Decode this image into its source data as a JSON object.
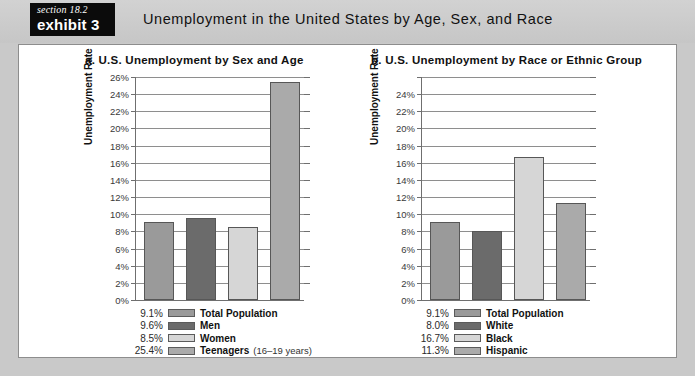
{
  "header": {
    "badge_section": "section 18.2",
    "badge_exhibit": "exhibit 3",
    "title": "Unemployment in the United States by Age, Sex, and Race"
  },
  "colors": {
    "page_background": "#c9c9c9",
    "panel_background": "#ffffff",
    "badge_background": "#0b0b0b",
    "axis": "#6f6f6f",
    "gridline": "#8e8e8e"
  },
  "chart_data": [
    {
      "type": "bar",
      "id": "a",
      "title": "a. U.S. Unemployment by Sex and Age",
      "xlabel": "",
      "ylabel": "Unemployment Rate",
      "ylim": [
        0,
        26
      ],
      "grid": true,
      "legend_position": "bottom-left",
      "yticks": [
        0,
        2,
        4,
        6,
        8,
        10,
        12,
        14,
        16,
        18,
        20,
        22,
        24,
        26
      ],
      "ytick_labels": [
        "0%",
        "2%",
        "4%",
        "6%",
        "8%",
        "10%",
        "12%",
        "14%",
        "16%",
        "18%",
        "20%",
        "22%",
        "24%",
        "26%"
      ],
      "categories": [
        "Total Population",
        "Men",
        "Women",
        "Teenagers"
      ],
      "values": [
        9.1,
        9.6,
        8.5,
        25.4
      ],
      "value_labels": [
        "9.1%",
        "9.6%",
        "8.5%",
        "25.4%"
      ],
      "bar_colors": [
        "#9a9a9a",
        "#6b6b6b",
        "#d6d6d6",
        "#aaaaaa"
      ],
      "legend": [
        {
          "value": "9.1%",
          "label": "Total Population",
          "note": "",
          "color": "#9a9a9a"
        },
        {
          "value": "9.6%",
          "label": "Men",
          "note": "",
          "color": "#6b6b6b"
        },
        {
          "value": "8.5%",
          "label": "Women",
          "note": "",
          "color": "#d6d6d6"
        },
        {
          "value": "25.4%",
          "label": "Teenagers",
          "note": "(16–19 years)",
          "color": "#aaaaaa"
        }
      ]
    },
    {
      "type": "bar",
      "id": "b",
      "title": "b. U.S. Unemployment by Race or Ethnic Group",
      "xlabel": "",
      "ylabel": "Unemployment Rate",
      "ylim": [
        0,
        26
      ],
      "grid": true,
      "legend_position": "bottom-left",
      "yticks": [
        0,
        2,
        4,
        6,
        8,
        10,
        12,
        14,
        16,
        18,
        20,
        22,
        24,
        26
      ],
      "ytick_labels": [
        "0%",
        "2%",
        "4%",
        "6%",
        "8%",
        "10%",
        "12%",
        "14%",
        "16%",
        "18%",
        "20%",
        "22%",
        "24%",
        ""
      ],
      "categories": [
        "Total Population",
        "White",
        "Black",
        "Hispanic"
      ],
      "values": [
        9.1,
        8.0,
        16.7,
        11.3
      ],
      "value_labels": [
        "9.1%",
        "8.0%",
        "16.7%",
        "11.3%"
      ],
      "bar_colors": [
        "#9a9a9a",
        "#6b6b6b",
        "#d6d6d6",
        "#aaaaaa"
      ],
      "legend": [
        {
          "value": "9.1%",
          "label": "Total Population",
          "note": "",
          "color": "#9a9a9a"
        },
        {
          "value": "8.0%",
          "label": "White",
          "note": "",
          "color": "#6b6b6b"
        },
        {
          "value": "16.7%",
          "label": "Black",
          "note": "",
          "color": "#d6d6d6"
        },
        {
          "value": "11.3%",
          "label": "Hispanic",
          "note": "",
          "color": "#aaaaaa"
        }
      ]
    }
  ]
}
